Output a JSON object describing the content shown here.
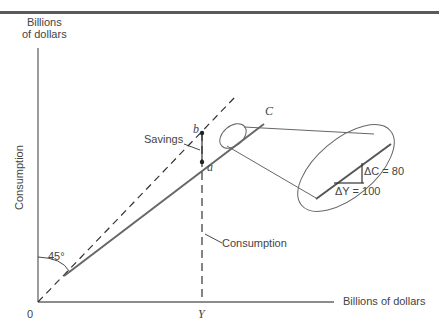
{
  "diagram": {
    "y_axis_unit": [
      "Billions",
      "of dollars"
    ],
    "y_axis_label": "Consumption",
    "x_axis_label": "Billions of dollars",
    "origin_label": "0",
    "income_marker": "Y",
    "consumption_function_label": "C",
    "point_b": "b",
    "point_a": "a",
    "savings_label": "Savings",
    "consumption_label": "Consumption",
    "angle_label": "45°",
    "delta_c_label": "ΔC = 80",
    "delta_y_label": "ΔY = 100"
  }
}
